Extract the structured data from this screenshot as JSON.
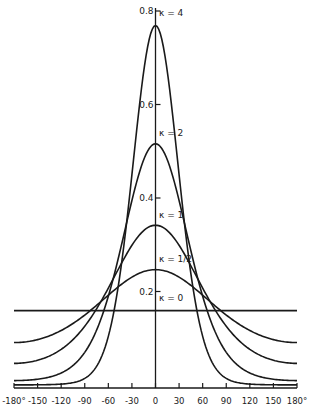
{
  "chart_data": {
    "type": "line",
    "title": "",
    "xlabel": "",
    "ylabel": "",
    "xlim": [
      -180,
      180
    ],
    "ylim": [
      0,
      0.8
    ],
    "grid": false,
    "legend": "inline labels at curve peaks",
    "x_ticks": [
      -180,
      -150,
      -120,
      -90,
      -60,
      -30,
      0,
      30,
      60,
      90,
      120,
      150,
      180
    ],
    "x_tick_labels": [
      "-180°",
      "-150",
      "-120",
      "-90",
      "-60",
      "-30",
      "0",
      "30",
      "60",
      "90",
      "120",
      "150",
      "180°"
    ],
    "y_ticks": [
      0.2,
      0.4,
      0.6,
      0.8
    ],
    "y_tick_labels": [
      "0.2",
      "0.4",
      "0.6",
      "0.8"
    ],
    "x": [
      -180,
      -150,
      -120,
      -90,
      -60,
      -30,
      0,
      30,
      60,
      90,
      120,
      150,
      180
    ],
    "series": [
      {
        "name": "κ=0",
        "label": "κ = 0",
        "kappa": 0,
        "values": [
          0.159,
          0.159,
          0.159,
          0.159,
          0.159,
          0.159,
          0.159,
          0.159,
          0.159,
          0.159,
          0.159,
          0.159,
          0.159
        ]
      },
      {
        "name": "κ=1/2",
        "label": "κ = 1/2",
        "kappa": 0.5,
        "values": [
          0.091,
          0.098,
          0.117,
          0.15,
          0.193,
          0.229,
          0.247,
          0.229,
          0.193,
          0.15,
          0.117,
          0.098,
          0.091
        ]
      },
      {
        "name": "κ=1",
        "label": "κ = 1",
        "kappa": 1,
        "values": [
          0.046,
          0.053,
          0.076,
          0.126,
          0.207,
          0.298,
          0.342,
          0.298,
          0.207,
          0.126,
          0.076,
          0.053,
          0.046
        ]
      },
      {
        "name": "κ=2",
        "label": "κ = 2",
        "kappa": 2,
        "values": [
          0.009,
          0.012,
          0.026,
          0.07,
          0.19,
          0.393,
          0.516,
          0.393,
          0.19,
          0.07,
          0.026,
          0.012,
          0.009
        ]
      },
      {
        "name": "κ=4",
        "label": "κ = 4",
        "kappa": 4,
        "values": [
          0.0003,
          0.0007,
          0.003,
          0.022,
          0.164,
          0.45,
          0.769,
          0.45,
          0.164,
          0.022,
          0.003,
          0.0007,
          0.0003
        ]
      }
    ]
  }
}
